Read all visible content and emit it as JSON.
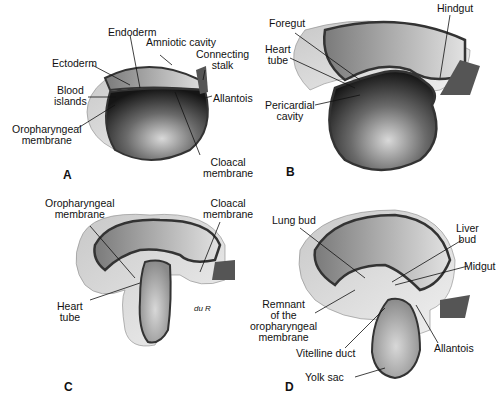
{
  "figure": {
    "panels": [
      {
        "id": "A",
        "letter": "A",
        "labels": {
          "endoderm": "Endoderm",
          "amniotic_cavity": "Amniotic cavity",
          "connecting_stalk_1": "Connecting",
          "connecting_stalk_2": "stalk",
          "ectoderm": "Ectoderm",
          "blood_islands_1": "Blood",
          "blood_islands_2": "islands",
          "allantois": "Allantois",
          "oropharyngeal_1": "Oropharyngeal",
          "oropharyngeal_2": "membrane",
          "cloacal_1": "Cloacal",
          "cloacal_2": "membrane"
        }
      },
      {
        "id": "B",
        "letter": "B",
        "labels": {
          "foregut": "Foregut",
          "hindgut": "Hindgut",
          "heart_tube_1": "Heart",
          "heart_tube_2": "tube",
          "pericardial_1": "Pericardial",
          "pericardial_2": "cavity"
        }
      },
      {
        "id": "C",
        "letter": "C",
        "labels": {
          "oropharyngeal_1": "Oropharyngeal",
          "oropharyngeal_2": "membrane",
          "cloacal_1": "Cloacal",
          "cloacal_2": "membrane",
          "heart_tube_1": "Heart",
          "heart_tube_2": "tube",
          "signature": "du R"
        }
      },
      {
        "id": "D",
        "letter": "D",
        "labels": {
          "lung_bud": "Lung bud",
          "liver_bud_1": "Liver",
          "liver_bud_2": "bud",
          "midgut": "Midgut",
          "remnant_1": "Remnant",
          "remnant_2": "of the",
          "remnant_3": "oropharyngeal",
          "remnant_4": "membrane",
          "vitelline_duct": "Vitelline duct",
          "allantois": "Allantois",
          "yolk_sac": "Yolk sac"
        }
      }
    ]
  }
}
